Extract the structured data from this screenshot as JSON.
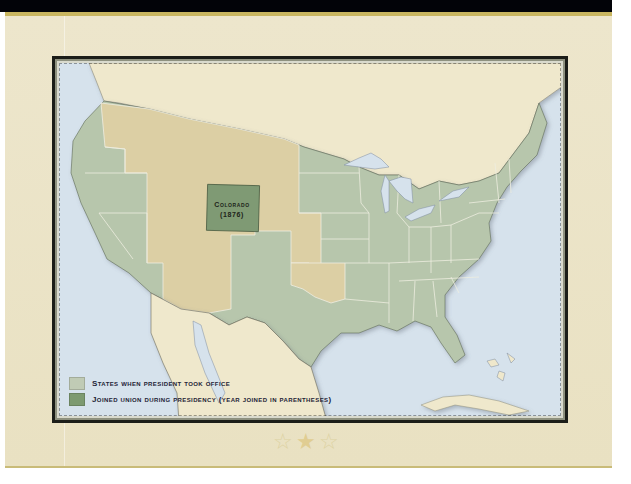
{
  "map": {
    "title": "United States territorial map",
    "colors": {
      "states": "#b7c6ac",
      "joined": "#7f9a74",
      "territories": "#dccfa4",
      "foreign_land": "#efe8cc",
      "water": "#d6e2ec",
      "border_line": "#efeee2"
    },
    "highlighted_state": {
      "name": "Colorado",
      "year": "(1876)"
    }
  },
  "legend": {
    "items": [
      {
        "label": "States when president took office",
        "color": "#c0cbb5"
      },
      {
        "label": "Joined Union during presidency (year joined in parentheses)",
        "color": "#7d9a70"
      }
    ]
  },
  "decoration": {
    "stars": [
      "☆",
      "★",
      "☆"
    ]
  }
}
